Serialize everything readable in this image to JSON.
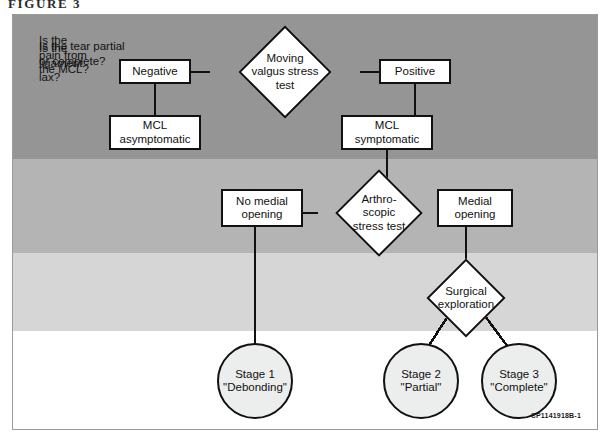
{
  "figure": {
    "caption": "FIGURE 3",
    "artwork_code": "CP1141918B-1"
  },
  "bands": [
    {
      "question": "Is the\npain from\nthe MCL?",
      "color": "#959595"
    },
    {
      "question": "Is the\nligament\nlax?",
      "color": "#b4b4b4"
    },
    {
      "question": "Is the tear partial\nor complete?",
      "color": "#d6d6d6"
    },
    {
      "question": "",
      "color": "#ffffff"
    }
  ],
  "nodes": {
    "moving_valgus": "Moving\nvalgus stress\ntest",
    "negative": "Negative",
    "positive": "Positive",
    "mcl_asymptomatic": "MCL\nasymptomatic",
    "mcl_symptomatic": "MCL\nsymptomatic",
    "arthroscopic": "Arthro-\nscopic\nstress test",
    "no_medial_opening": "No medial\nopening",
    "medial_opening": "Medial\nopening",
    "surgical_exploration": "Surgical\nexploration",
    "stage_1": "Stage 1\n\"Debonding\"",
    "stage_2": "Stage 2\n\"Partial\"",
    "stage_3": "Stage 3\n\"Complete\""
  },
  "colors": {
    "line": "#111111",
    "node_fill": "#ffffff",
    "circle_fill": "#eceded",
    "frame_border": "#9a9a9a"
  }
}
